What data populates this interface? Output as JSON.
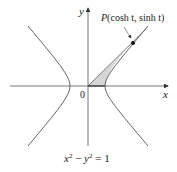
{
  "diagram": {
    "type": "hyperbola-plot",
    "axes": {
      "x_label": "x",
      "y_label": "y",
      "origin_label": "0"
    },
    "point": {
      "label_prefix": "P",
      "label_args": "(cosh t, sinh t)"
    },
    "equation": {
      "lhs_a": "x",
      "exp_a": "2",
      "minus": " − ",
      "lhs_b": "y",
      "exp_b": "2",
      "rhs": " = 1"
    },
    "colors": {
      "curve": "#555555",
      "shade": "#d9d9d9",
      "axis": "#555555"
    }
  }
}
